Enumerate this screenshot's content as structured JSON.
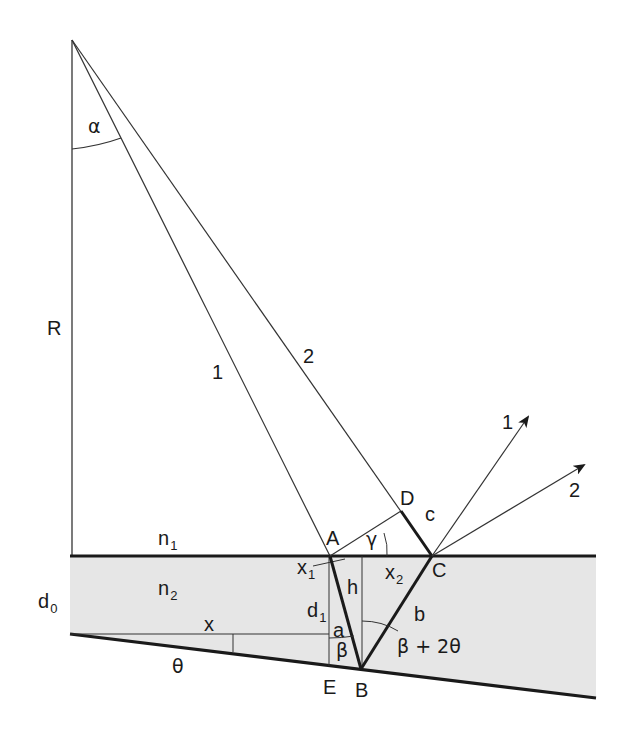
{
  "figure": {
    "type": "ray-optics-wedge-diagram",
    "colors": {
      "line": "#1a1a1a",
      "thin_line": "#333333",
      "shaded_medium": "#e6e6e6",
      "background": "#ffffff"
    },
    "labels": {
      "alpha": "α",
      "R": "R",
      "ray1_incident": "1",
      "ray2_incident": "2",
      "ray1_out": "1",
      "ray2_out": "2",
      "D": "D",
      "c": "c",
      "A": "A",
      "gamma": "γ",
      "C": "C",
      "n1_main": "n",
      "n1_sub": "1",
      "n2_main": "n",
      "n2_sub": "2",
      "d0_main": "d",
      "d0_sub": "0",
      "x1_main": "x",
      "x1_sub": "1",
      "x2_main": "x",
      "x2_sub": "2",
      "h": "h",
      "d1_main": "d",
      "d1_sub": "1",
      "a": "a",
      "b": "b",
      "x": "x",
      "beta": "β",
      "beta_plus_2theta": "β + 2θ",
      "theta": "θ",
      "E": "E",
      "B": "B"
    },
    "points": {
      "apex": [
        72,
        40
      ],
      "A": [
        330,
        556
      ],
      "C": [
        432,
        556
      ],
      "B": [
        361,
        669
      ],
      "E": [
        329,
        664
      ],
      "D": [
        401,
        511
      ]
    }
  }
}
